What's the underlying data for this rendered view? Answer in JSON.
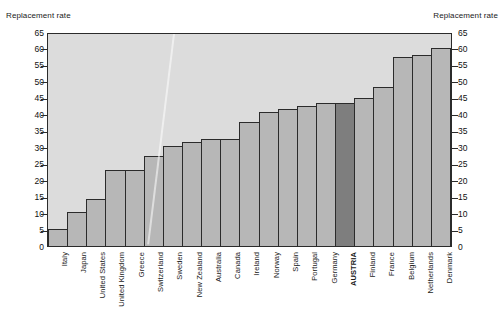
{
  "axis_titles": {
    "left": "Replacement rate",
    "right": "Replacement rate"
  },
  "chart_data": {
    "type": "bar",
    "title": "",
    "xlabel": "",
    "ylabel": "Replacement rate",
    "ylim": [
      0,
      65
    ],
    "ytick_step": 5,
    "yticks": [
      0,
      5,
      10,
      15,
      20,
      25,
      30,
      35,
      40,
      45,
      50,
      55,
      60,
      65
    ],
    "grid": false,
    "legend": "none",
    "dual_y_axis": true,
    "highlight_category": "AUSTRIA",
    "colors": {
      "bar": "#b7b7b7",
      "bar_highlight": "#7e7e7e",
      "bar_outline": "#2b2b2b",
      "plot_background": "#dcdcdc",
      "page_background": "#ffffff",
      "text": "#1a1a1a"
    },
    "categories": [
      "Italy",
      "Japan",
      "United States",
      "United Kingdom",
      "Greece",
      "Switzerland",
      "Sweden",
      "New Zealand",
      "Australia",
      "Canada",
      "Ireland",
      "Norway",
      "Spain",
      "Portugal",
      "Germany",
      "AUSTRIA",
      "Finland",
      "France",
      "Belgium",
      "Netherlands",
      "Denmark"
    ],
    "values": [
      5.2,
      10.2,
      14.2,
      23.1,
      23.2,
      27.3,
      30.5,
      31.6,
      32.4,
      32.4,
      37.8,
      40.6,
      41.6,
      42.6,
      43.5,
      43.5,
      45.0,
      48.3,
      57.3,
      58.0,
      60.0
    ]
  }
}
